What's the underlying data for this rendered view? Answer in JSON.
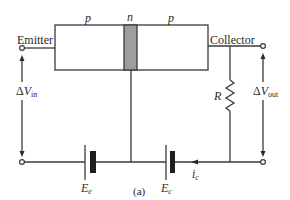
{
  "diagram": {
    "caption": "(a)",
    "regions": [
      {
        "label": "p",
        "role": "emitter-region"
      },
      {
        "label": "n",
        "role": "base-region"
      },
      {
        "label": "p",
        "role": "collector-region"
      }
    ],
    "terminals": {
      "emitter": "Emitter",
      "collector": "Collector"
    },
    "input_voltage": {
      "prefix": "Δ",
      "symbol": "V",
      "subscript": "in"
    },
    "output_voltage": {
      "prefix": "Δ",
      "symbol": "V",
      "subscript": "out"
    },
    "resistor": {
      "label": "R"
    },
    "batteries": [
      {
        "symbol": "E",
        "subscript": "e"
      },
      {
        "symbol": "E",
        "subscript": "c"
      }
    ],
    "current": {
      "symbol": "i",
      "subscript": "c"
    },
    "colors": {
      "line": "#3a3a3a",
      "base_fill": "#9e9e9e",
      "background": "#ffffff"
    }
  }
}
